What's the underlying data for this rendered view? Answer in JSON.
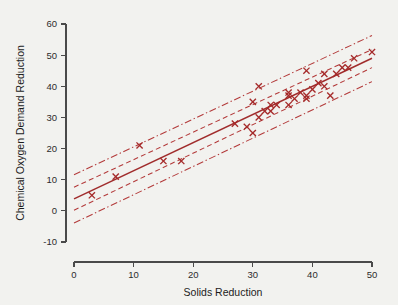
{
  "figure": {
    "background_color": "#f2f2ef",
    "plot_color": "#a02c2c",
    "marker_color": "#a52a2a"
  },
  "chart_data": {
    "type": "scatter",
    "title": "",
    "xlabel": "Solids Reduction",
    "ylabel": "Chemical Oxygen Demand Reduction",
    "xlim": [
      0,
      50
    ],
    "ylim": [
      -10,
      60
    ],
    "xticks": [
      0,
      10,
      20,
      30,
      40,
      50
    ],
    "yticks": [
      -10,
      0,
      10,
      20,
      30,
      40,
      50,
      60
    ],
    "xtick_labels": [
      "0",
      "10",
      "20",
      "30",
      "40",
      "50"
    ],
    "ytick_labels": [
      "-10",
      "0",
      "10",
      "20",
      "30",
      "40",
      "50",
      "60"
    ],
    "grid": false,
    "legend": false,
    "marker_symbol": "x",
    "x": [
      3,
      7,
      11,
      15,
      18,
      27,
      29,
      30,
      30,
      31,
      31,
      32,
      33,
      33,
      34,
      36,
      36,
      36,
      37,
      38,
      39,
      39,
      39,
      40,
      41,
      42,
      42,
      43,
      44,
      45,
      46,
      47,
      50
    ],
    "y": [
      5,
      11,
      21,
      16,
      16,
      28,
      27,
      25,
      35,
      30,
      40,
      32,
      34,
      32,
      34,
      37,
      38,
      34,
      36,
      38,
      37,
      36,
      45,
      39,
      41,
      40,
      44,
      37,
      44,
      46,
      46,
      49,
      51
    ],
    "fit_line": {
      "label": "least-squares fit",
      "style": "solid",
      "intercept": 3.83,
      "slope": 0.904,
      "endpoints": [
        [
          0,
          3.83
        ],
        [
          50,
          49.0
        ]
      ]
    },
    "bands": [
      {
        "label": "confidence band (inner)",
        "style": "dashed",
        "upper_endpoints": [
          [
            0,
            7.6
          ],
          [
            50,
            51.8
          ]
        ],
        "lower_endpoints": [
          [
            0,
            0.2
          ],
          [
            50,
            46.0
          ]
        ]
      },
      {
        "label": "prediction band (outer)",
        "style": "dash-dot",
        "upper_endpoints": [
          [
            0,
            11.6
          ],
          [
            50,
            56.3
          ]
        ],
        "lower_endpoints": [
          [
            0,
            -3.9
          ],
          [
            50,
            41.5
          ]
        ]
      }
    ]
  }
}
